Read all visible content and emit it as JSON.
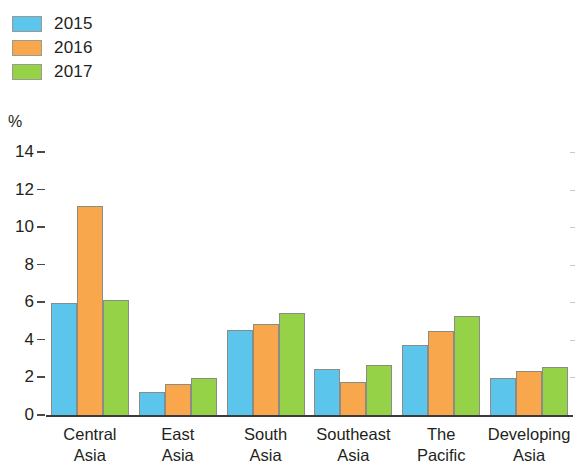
{
  "chart_data": {
    "type": "bar",
    "title": "",
    "subtitle": "",
    "xlabel": "",
    "ylabel": "%",
    "ylim": [
      0,
      14
    ],
    "yticks": [
      0,
      2,
      4,
      6,
      8,
      10,
      12,
      14
    ],
    "grid": false,
    "legend_position": "top-left",
    "categories": [
      "Central Asia",
      "East Asia",
      "South Asia",
      "Southeast Asia",
      "The Pacific",
      "Developing Asia"
    ],
    "series": [
      {
        "name": "2015",
        "color": "#5BC5EC",
        "values": [
          6.0,
          1.3,
          4.6,
          2.5,
          3.8,
          2.0
        ]
      },
      {
        "name": "2016",
        "color": "#F8A74C",
        "values": [
          11.2,
          1.7,
          4.9,
          1.8,
          4.5,
          2.4
        ]
      },
      {
        "name": "2017",
        "color": "#96D247",
        "values": [
          6.2,
          2.0,
          5.5,
          2.7,
          5.3,
          2.6
        ]
      }
    ]
  },
  "axis": {
    "unit_label": "%",
    "tick_labels": [
      "14",
      "12",
      "10",
      "8",
      "6",
      "4",
      "2",
      "0"
    ]
  },
  "legend": {
    "items": [
      {
        "label": "2015",
        "color": "#5BC5EC"
      },
      {
        "label": "2016",
        "color": "#F8A74C"
      },
      {
        "label": "2017",
        "color": "#96D247"
      }
    ]
  },
  "categories_wrapped": [
    [
      "Central",
      "Asia"
    ],
    [
      "East",
      "Asia"
    ],
    [
      "South",
      "Asia"
    ],
    [
      "Southeast",
      "Asia"
    ],
    [
      "The",
      "Pacific"
    ],
    [
      "Developing",
      "Asia"
    ]
  ]
}
